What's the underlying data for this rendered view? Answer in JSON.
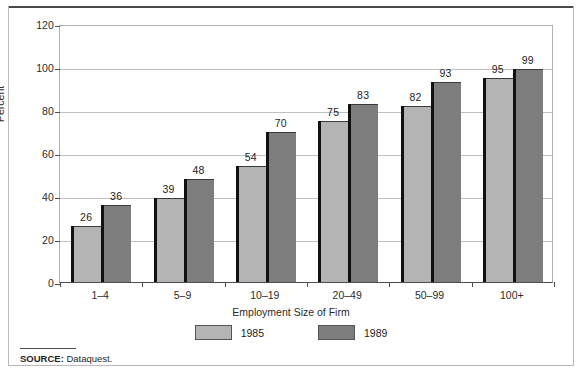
{
  "chart_data": {
    "type": "bar",
    "title": "",
    "subtitle": "",
    "xlabel": "Employment Size of Firm",
    "ylabel": "Percent",
    "categories": [
      "1–4",
      "5–9",
      "10–19",
      "20–49",
      "50–99",
      "100+"
    ],
    "series": [
      {
        "name": "1985",
        "color": "#b4b4b4",
        "values": [
          26,
          39,
          54,
          75,
          82,
          95
        ]
      },
      {
        "name": "1989",
        "color": "#7d7d7d",
        "values": [
          36,
          48,
          70,
          83,
          93,
          99
        ]
      }
    ],
    "ylim": [
      0,
      120
    ],
    "yticks": [
      0,
      20,
      40,
      60,
      80,
      100,
      120
    ],
    "ytick_labels": [
      "0",
      "20",
      "40",
      "60",
      "80",
      "100",
      "120"
    ],
    "grid": true,
    "grid_axis": "y",
    "legend_position": "bottom-center",
    "data_labels": true
  },
  "legend": {
    "items": [
      {
        "label": "1985",
        "color": "#b4b4b4"
      },
      {
        "label": "1989",
        "color": "#7d7d7d"
      }
    ]
  },
  "footer": {
    "source_prefix": "SOURCE:",
    "source_text": "Dataquest."
  }
}
